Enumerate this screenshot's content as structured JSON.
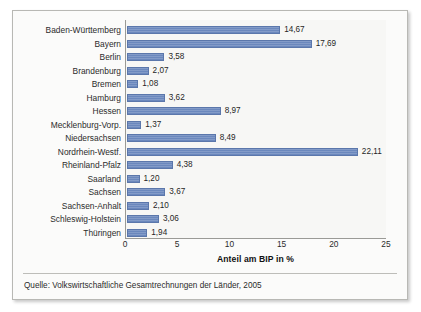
{
  "chart_data": {
    "type": "bar",
    "orientation": "horizontal",
    "title": "",
    "xlabel": "Anteil am BIP in %",
    "ylabel": "",
    "xlim": [
      0,
      25
    ],
    "xticks": [
      0,
      5,
      10,
      15,
      20,
      25
    ],
    "xtick_labels": [
      "0",
      "5",
      "10",
      "15",
      "20",
      "25"
    ],
    "grid": false,
    "legend": false,
    "bar_color": "#6b88bd",
    "categories": [
      "Baden-Württemberg",
      "Bayern",
      "Berlin",
      "Brandenburg",
      "Bremen",
      "Hamburg",
      "Hessen",
      "Mecklenburg-Vorp.",
      "Niedersachsen",
      "Nordrhein-Westf.",
      "Rheinland-Pfalz",
      "Saarland",
      "Sachsen",
      "Sachsen-Anhalt",
      "Schleswig-Holstein",
      "Thüringen"
    ],
    "values": [
      14.67,
      17.69,
      3.58,
      2.07,
      1.08,
      3.62,
      8.97,
      1.37,
      8.49,
      22.11,
      4.38,
      1.2,
      3.67,
      2.1,
      3.06,
      1.94
    ],
    "value_labels": [
      "14,67",
      "17,69",
      "3,58",
      "2,07",
      "1,08",
      "3,62",
      "8,97",
      "1,37",
      "8,49",
      "22,11",
      "4,38",
      "1,20",
      "3,67",
      "2,10",
      "3,06",
      "1,94"
    ]
  },
  "source": {
    "text": "Quelle: Volkswirtschaftliche Gesamtrechnungen der Länder, 2005"
  }
}
